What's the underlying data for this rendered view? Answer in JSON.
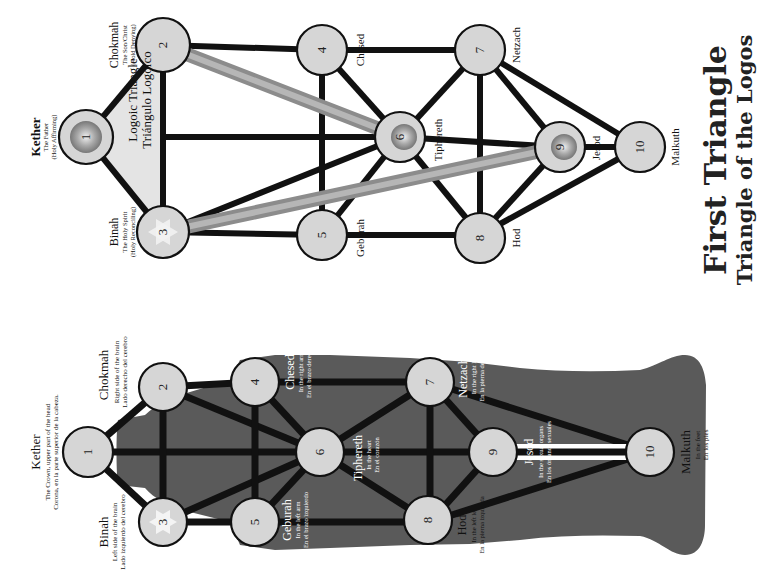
{
  "title": {
    "main": "First Triangle",
    "sub": "Triangle of the Logos"
  },
  "top_diagram": {
    "triangle_label": [
      "Logoic Triangle",
      "Triángulo Logoico"
    ],
    "sephiroth": [
      {
        "num": "1",
        "name": "Kether",
        "lines": [
          "The Father",
          "(Holy Affirming)"
        ]
      },
      {
        "num": "2",
        "name": "Chokmah",
        "lines": [
          "The Son/Christ",
          "(Hold Denying)"
        ]
      },
      {
        "num": "3",
        "name": "Binah",
        "lines": [
          "The Holy Spirit",
          "(Holy Reconciling)"
        ]
      },
      {
        "num": "4",
        "name": "Chesed",
        "lines": []
      },
      {
        "num": "5",
        "name": "Geburah",
        "lines": []
      },
      {
        "num": "6",
        "name": "Tiphereth",
        "lines": []
      },
      {
        "num": "7",
        "name": "Netzach",
        "lines": []
      },
      {
        "num": "8",
        "name": "Hod",
        "lines": []
      },
      {
        "num": "9",
        "name": "Jesod",
        "lines": []
      },
      {
        "num": "10",
        "name": "Malkuth",
        "lines": []
      }
    ]
  },
  "bottom_diagram": {
    "sephiroth": [
      {
        "num": "1",
        "name": "Kether",
        "lines": [
          "The Crown, upper part of the head",
          "Corona, en la parte superior de la cabeza."
        ]
      },
      {
        "num": "2",
        "name": "Chokmah",
        "lines": [
          "Right side of the brain",
          "Lado derecho del cerebro"
        ]
      },
      {
        "num": "3",
        "name": "Binah",
        "lines": [
          "Left side of the brain",
          "Lado izquierdo del cerebro"
        ]
      },
      {
        "num": "4",
        "name": "Chesed",
        "lines": [
          "In the right arm",
          "En el brazo derecho"
        ]
      },
      {
        "num": "5",
        "name": "Geburah",
        "lines": [
          "In the left arm",
          "En el brazo izquierdo"
        ]
      },
      {
        "num": "6",
        "name": "Tiphereth",
        "lines": [
          "In the heart",
          "En el corazón"
        ]
      },
      {
        "num": "7",
        "name": "Netzach",
        "lines": [
          "In the right leg",
          "En la pierna derecha"
        ]
      },
      {
        "num": "8",
        "name": "Hod",
        "lines": [
          "In the left leg",
          "En la pierna izquierda"
        ]
      },
      {
        "num": "9",
        "name": "Jesod",
        "lines": [
          "In the sexual organs",
          "En los órganos sexuales"
        ]
      },
      {
        "num": "10",
        "name": "Malkuth",
        "lines": [
          "In the feet",
          "En los pies"
        ]
      }
    ]
  },
  "colors": {
    "node_fill": "#d6d6d6",
    "path": "#111111",
    "logos_path": "#8c8c8c",
    "silhouette": "#5a5a5a",
    "triangle_fill": "#e4e4e4"
  }
}
